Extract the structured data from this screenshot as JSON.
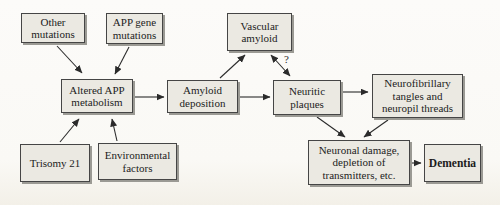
{
  "diagram": {
    "colors": {
      "box_fill": "#ebe9e2",
      "box_border": "#454545",
      "box_shadow": "#9b9a94",
      "arrow": "#2b2b2b",
      "background": "#fbfaf7",
      "text": "#1c1c1c"
    },
    "nodes": {
      "other_mutations": {
        "label": "Other mutations"
      },
      "app_gene_mutations": {
        "label": "APP gene mutations"
      },
      "vascular_amyloid": {
        "label": "Vascular amyloid"
      },
      "altered_app_metabolism": {
        "label": "Altered APP metabolism"
      },
      "amyloid_deposition": {
        "label": "Amyloid deposition"
      },
      "neuritic_plaques": {
        "label": "Neuritic plaques"
      },
      "neurofibrillary_tangles": {
        "label": "Neurofibrillary tangles and neuropil threads"
      },
      "trisomy_21": {
        "label": "Trisomy 21"
      },
      "environmental_factors": {
        "label": "Environmental factors"
      },
      "neuronal_damage": {
        "label": "Neuronal damage, depletion of transmitters, etc."
      },
      "dementia": {
        "label": "Dementia"
      }
    },
    "edges": [
      {
        "from": "other_mutations",
        "to": "altered_app_metabolism",
        "bidirectional": false,
        "label": ""
      },
      {
        "from": "app_gene_mutations",
        "to": "altered_app_metabolism",
        "bidirectional": false,
        "label": ""
      },
      {
        "from": "trisomy_21",
        "to": "altered_app_metabolism",
        "bidirectional": false,
        "label": ""
      },
      {
        "from": "environmental_factors",
        "to": "altered_app_metabolism",
        "bidirectional": false,
        "label": ""
      },
      {
        "from": "altered_app_metabolism",
        "to": "amyloid_deposition",
        "bidirectional": false,
        "label": ""
      },
      {
        "from": "amyloid_deposition",
        "to": "vascular_amyloid",
        "bidirectional": false,
        "label": ""
      },
      {
        "from": "amyloid_deposition",
        "to": "neuritic_plaques",
        "bidirectional": false,
        "label": ""
      },
      {
        "from": "vascular_amyloid",
        "to": "neuritic_plaques",
        "bidirectional": true,
        "label": "?"
      },
      {
        "from": "neuritic_plaques",
        "to": "neurofibrillary_tangles",
        "bidirectional": false,
        "label": ""
      },
      {
        "from": "neuritic_plaques",
        "to": "neuronal_damage",
        "bidirectional": false,
        "label": ""
      },
      {
        "from": "neurofibrillary_tangles",
        "to": "neuronal_damage",
        "bidirectional": false,
        "label": ""
      },
      {
        "from": "neuronal_damage",
        "to": "dementia",
        "bidirectional": false,
        "label": ""
      }
    ]
  }
}
